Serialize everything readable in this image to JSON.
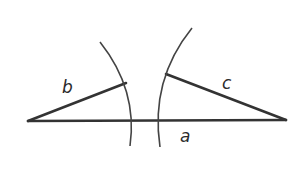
{
  "diagram": {
    "colors": {
      "stroke": "#333333",
      "arc": "#444444",
      "background": "#ffffff"
    },
    "labels": {
      "a": "a",
      "b": "b",
      "c": "c"
    }
  }
}
